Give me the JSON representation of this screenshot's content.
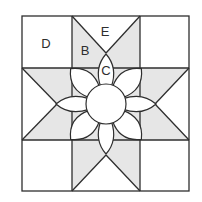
{
  "diagram": {
    "colors": {
      "star_fill": "#e6e6e6",
      "background": "#ffffff",
      "line": "#2e2e2e"
    },
    "labels": {
      "D": "D",
      "B": "B",
      "E": "E",
      "C": "C"
    },
    "pieces": [
      {
        "id": "D",
        "description": "corner square (white)"
      },
      {
        "id": "B",
        "description": "star point diamond (gray)"
      },
      {
        "id": "E",
        "description": "side setting triangle (white)"
      },
      {
        "id": "C",
        "description": "petal (white)"
      }
    ],
    "petal_count": 8
  }
}
